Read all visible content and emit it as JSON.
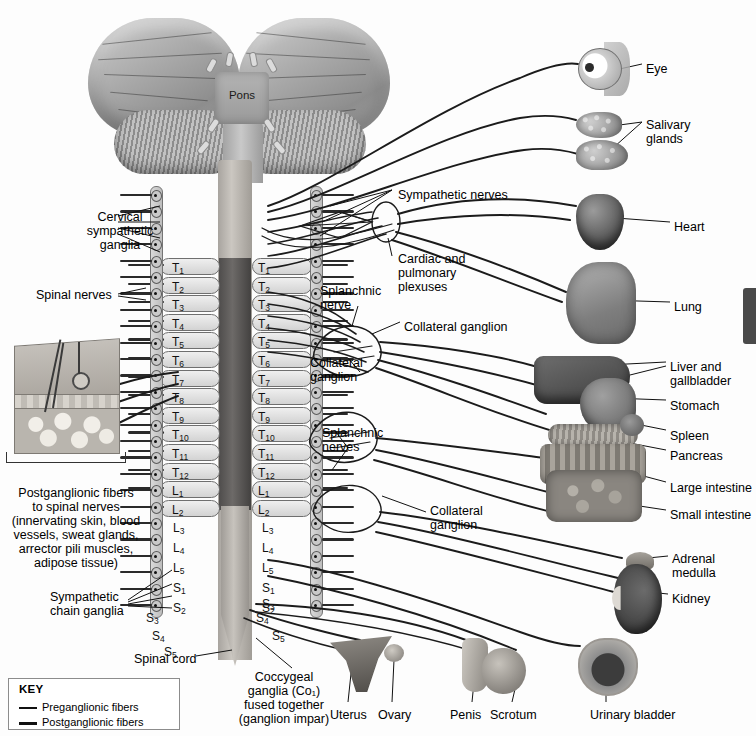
{
  "figure": {
    "background_color": "#fdfdfd",
    "line_color": "#111111"
  },
  "brain": {
    "pons_label": "Pons"
  },
  "left_labels": [
    {
      "id": "cervical-sympathetic-ganglia",
      "text": "Cervical\nsympathetic\nganglia",
      "x": 52,
      "y": 210,
      "align": "center"
    },
    {
      "id": "spinal-nerves",
      "text": "Spinal nerves",
      "x": 36,
      "y": 288,
      "align": "left"
    },
    {
      "id": "postganglionic-fibers",
      "text": "Postganglionic fibers\nto spinal nerves\n(innervating skin, blood\nvessels, sweat glands,\narrector pili muscles,\nadipose tissue)",
      "x": 8,
      "y": 486,
      "align": "center"
    },
    {
      "id": "sympathetic-chain-ganglia",
      "text": "Sympathetic\nchain ganglia",
      "x": 50,
      "y": 590,
      "align": "left"
    },
    {
      "id": "spinal-cord",
      "text": "Spinal cord",
      "x": 134,
      "y": 652,
      "align": "left"
    }
  ],
  "center_labels": [
    {
      "id": "sympathetic-nerves",
      "text": "Sympathetic nerves",
      "x": 398,
      "y": 188,
      "align": "left"
    },
    {
      "id": "cardiac-and-pulmonary-plexuses",
      "text": "Cardiac and\npulmonary\nplexuses",
      "x": 398,
      "y": 252,
      "align": "left"
    },
    {
      "id": "splanchnic-nerve",
      "text": "Splanchnic\nnerve",
      "x": 320,
      "y": 284,
      "align": "left"
    },
    {
      "id": "collateral-ganglion-top",
      "text": "Collateral ganglion",
      "x": 404,
      "y": 320,
      "align": "left"
    },
    {
      "id": "collateral-ganglion-mid",
      "text": "Collateral\nganglion",
      "x": 310,
      "y": 356,
      "align": "left"
    },
    {
      "id": "splanchnic-nerves",
      "text": "Splanchnic\nnerves",
      "x": 322,
      "y": 426,
      "align": "left"
    },
    {
      "id": "collateral-ganglion-low",
      "text": "Collateral\nganglion",
      "x": 430,
      "y": 504,
      "align": "left"
    },
    {
      "id": "coccygeal-ganglia",
      "text": "Coccygeal\nganglia (Co₁)\nfused together\n(ganglion impar)",
      "x": 228,
      "y": 670,
      "align": "center"
    }
  ],
  "organ_labels": [
    {
      "id": "eye",
      "text": "Eye",
      "x": 646,
      "y": 62
    },
    {
      "id": "salivary-glands",
      "text": "Salivary\nglands",
      "x": 646,
      "y": 118
    },
    {
      "id": "heart",
      "text": "Heart",
      "x": 674,
      "y": 220
    },
    {
      "id": "lung",
      "text": "Lung",
      "x": 674,
      "y": 300
    },
    {
      "id": "liver-and-gallbladder",
      "text": "Liver and\ngallbladder",
      "x": 670,
      "y": 360
    },
    {
      "id": "stomach",
      "text": "Stomach",
      "x": 670,
      "y": 399
    },
    {
      "id": "spleen",
      "text": "Spleen",
      "x": 670,
      "y": 429
    },
    {
      "id": "pancreas",
      "text": "Pancreas",
      "x": 670,
      "y": 449
    },
    {
      "id": "large-intestine",
      "text": "Large intestine",
      "x": 670,
      "y": 481
    },
    {
      "id": "small-intestine",
      "text": "Small intestine",
      "x": 670,
      "y": 508
    },
    {
      "id": "adrenal-medulla",
      "text": "Adrenal\nmedulla",
      "x": 672,
      "y": 552
    },
    {
      "id": "kidney",
      "text": "Kidney",
      "x": 672,
      "y": 592
    },
    {
      "id": "urinary-bladder",
      "text": "Urinary bladder",
      "x": 590,
      "y": 708
    },
    {
      "id": "uterus",
      "text": "Uterus",
      "x": 330,
      "y": 708
    },
    {
      "id": "ovary",
      "text": "Ovary",
      "x": 378,
      "y": 708
    },
    {
      "id": "penis",
      "text": "Penis",
      "x": 450,
      "y": 708
    },
    {
      "id": "scrotum",
      "text": "Scrotum",
      "x": 490,
      "y": 708
    }
  ],
  "spinal_segments": {
    "left_column": [
      "T1",
      "T2",
      "T3",
      "T4",
      "T5",
      "T6",
      "T7",
      "T8",
      "T9",
      "T10",
      "T11",
      "T12",
      "L1",
      "L2",
      "L3",
      "L4",
      "L5",
      "S1",
      "S2",
      "S3",
      "S4",
      "S5"
    ],
    "right_column": [
      "T1",
      "T2",
      "T3",
      "T4",
      "T5",
      "T6",
      "T7",
      "T8",
      "T9",
      "T10",
      "T11",
      "T12",
      "L1",
      "L2",
      "L3",
      "L4",
      "L5",
      "S1",
      "S2",
      "S3",
      "S4",
      "S5"
    ]
  },
  "key": {
    "title": "KEY",
    "items": [
      {
        "label": "Preganglionic fibers",
        "weight": "thin"
      },
      {
        "label": "Postganglionic fibers",
        "weight": "thick"
      }
    ]
  }
}
